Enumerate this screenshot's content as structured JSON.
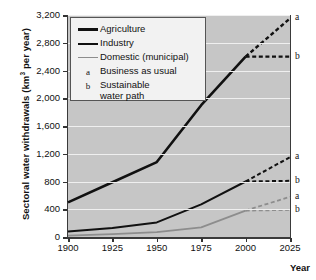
{
  "chart_data": {
    "type": "line",
    "title": "",
    "xlabel": "Year",
    "ylabel": "Sectoral water withdrawals (km3 per year)",
    "ylabel_prefix": "Sectoral water withdrawals (km",
    "ylabel_sup": "3",
    "ylabel_suffix": " per year)",
    "xlim": [
      1900,
      2025
    ],
    "ylim": [
      0,
      3200
    ],
    "xticks": [
      "1900",
      "1925",
      "1950",
      "1975",
      "2000",
      "2025"
    ],
    "xtick_values": [
      1900,
      1925,
      1950,
      1975,
      2000,
      2025
    ],
    "yticks": [
      "0",
      "400",
      "800",
      "1,200",
      "1,600",
      "2,000",
      "2,400",
      "2,800",
      "3,200"
    ],
    "ytick_values": [
      0,
      400,
      800,
      1200,
      1600,
      2000,
      2400,
      2800,
      3200
    ],
    "grid": true,
    "grid_color": "#efefef",
    "plot_bgcolor": "#c6c6c6",
    "legend_position": "upper-left",
    "series": [
      {
        "name": "Agriculture",
        "color": "#111111",
        "width": 2.6,
        "x": [
          1900,
          1925,
          1950,
          1975,
          2000
        ],
        "values": [
          500,
          790,
          1080,
          1900,
          2600
        ]
      },
      {
        "name": "Industry",
        "color": "#111111",
        "width": 2.0,
        "x": [
          1900,
          1925,
          1950,
          1975,
          2000
        ],
        "values": [
          80,
          130,
          210,
          470,
          800
        ]
      },
      {
        "name": "Domestic (municipal)",
        "color": "#8d8d8d",
        "width": 1.8,
        "x": [
          1900,
          1925,
          1950,
          1975,
          2000
        ],
        "values": [
          20,
          40,
          70,
          140,
          380
        ]
      }
    ],
    "projections": [
      {
        "series": "Agriculture",
        "scenario": "a",
        "color": "#111111",
        "width": 2.4,
        "x": [
          2000,
          2025
        ],
        "values": [
          2600,
          3150
        ]
      },
      {
        "series": "Agriculture",
        "scenario": "b",
        "color": "#111111",
        "width": 2.4,
        "x": [
          2000,
          2025
        ],
        "values": [
          2600,
          2600
        ]
      },
      {
        "series": "Industry",
        "scenario": "a",
        "color": "#111111",
        "width": 2.0,
        "x": [
          2000,
          2025
        ],
        "values": [
          800,
          1150
        ]
      },
      {
        "series": "Industry",
        "scenario": "b",
        "color": "#111111",
        "width": 2.0,
        "x": [
          2000,
          2025
        ],
        "values": [
          800,
          810
        ]
      },
      {
        "series": "Domestic (municipal)",
        "scenario": "a",
        "color": "#8d8d8d",
        "width": 1.8,
        "x": [
          2000,
          2025
        ],
        "values": [
          380,
          580
        ]
      },
      {
        "series": "Domestic (municipal)",
        "scenario": "b",
        "color": "#8d8d8d",
        "width": 1.8,
        "x": [
          2000,
          2025
        ],
        "values": [
          380,
          390
        ]
      }
    ],
    "annotations": [
      {
        "text": "a",
        "x": 2025,
        "y": 3150,
        "series": "Agriculture"
      },
      {
        "text": "b",
        "x": 2025,
        "y": 2600,
        "series": "Agriculture"
      },
      {
        "text": "a",
        "x": 2025,
        "y": 1150,
        "series": "Industry"
      },
      {
        "text": "b",
        "x": 2025,
        "y": 810,
        "series": "Industry"
      },
      {
        "text": "a",
        "x": 2025,
        "y": 580,
        "series": "Domestic (municipal)"
      },
      {
        "text": "b",
        "x": 2025,
        "y": 390,
        "series": "Domestic (municipal)"
      }
    ]
  },
  "legend": {
    "entries": [
      {
        "key": "line-agriculture",
        "label": "Agriculture"
      },
      {
        "key": "line-industry",
        "label": "Industry"
      },
      {
        "key": "line-domestic",
        "label": "Domestic (municipal)"
      },
      {
        "key": "a",
        "label": "Business as usual"
      },
      {
        "key": "b",
        "label": "Sustainable\nwater path"
      }
    ],
    "key_a": "a",
    "key_b": "b"
  }
}
